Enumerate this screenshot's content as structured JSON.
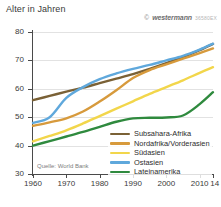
{
  "header": {
    "axis_title": "Alter in Jahren",
    "copyright_symbol": "©",
    "brand": "westermann",
    "code": "36580EX"
  },
  "source": {
    "text": "Quelle: World Bank"
  },
  "legend": {
    "items": [
      {
        "label": "Subsahara-Afrika",
        "color": "#7a6136"
      },
      {
        "label": "Nordafrika/Vorderasien",
        "color": "#d79a3c"
      },
      {
        "label": "Südasien",
        "color": "#f2d64b"
      },
      {
        "label": "Ostasien",
        "color": "#5fa8dc"
      },
      {
        "label": "Lateinamerika",
        "color": "#2f8a3e"
      }
    ]
  },
  "chart_data": {
    "type": "line",
    "title": "Alter in Jahren",
    "xlabel": "",
    "ylabel": "Alter in Jahren",
    "xlim": [
      1960,
      2014
    ],
    "ylim": [
      30,
      80
    ],
    "grid": true,
    "legend_position": "bottom-right",
    "xticks": [
      1960,
      1970,
      1980,
      1990,
      2000,
      2010,
      2014
    ],
    "xtick_labels": [
      "1960",
      "1970",
      "1980",
      "1990",
      "2000",
      "2010",
      "14"
    ],
    "yticks": [
      30,
      40,
      50,
      60,
      70,
      80
    ],
    "ytick_labels": [
      "30",
      "40",
      "50",
      "60",
      "70",
      "80"
    ],
    "x": [
      1960,
      1965,
      1970,
      1975,
      1980,
      1985,
      1990,
      1995,
      2000,
      2005,
      2010,
      2014
    ],
    "series": [
      {
        "name": "Subsahara-Afrika",
        "color": "#7a6136",
        "values": [
          56.0,
          57.5,
          59.0,
          60.4,
          62.0,
          63.6,
          65.2,
          67.0,
          69.0,
          71.2,
          73.6,
          75.8
        ]
      },
      {
        "name": "Nordafrika/Vorderasien",
        "color": "#d79a3c",
        "values": [
          47.0,
          48.2,
          49.6,
          52.0,
          55.5,
          59.5,
          63.8,
          66.6,
          68.6,
          70.6,
          72.6,
          74.2
        ]
      },
      {
        "name": "Südasien",
        "color": "#f2d64b",
        "values": [
          41.5,
          43.4,
          45.4,
          47.8,
          50.4,
          53.0,
          55.6,
          58.2,
          60.6,
          63.0,
          65.6,
          67.6
        ]
      },
      {
        "name": "Ostasien",
        "color": "#5fa8dc",
        "values": [
          48.0,
          50.0,
          56.8,
          60.6,
          63.4,
          65.4,
          67.0,
          68.4,
          70.0,
          71.6,
          73.8,
          75.9
        ]
      },
      {
        "name": "Lateinamerika",
        "color": "#2f8a3e",
        "values": [
          40.0,
          41.6,
          43.2,
          44.8,
          46.6,
          48.4,
          49.6,
          49.8,
          49.9,
          50.6,
          54.6,
          58.8
        ]
      }
    ]
  }
}
